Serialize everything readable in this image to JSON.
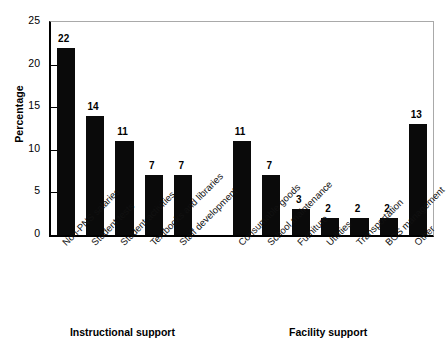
{
  "chart_data": {
    "type": "bar",
    "title": "",
    "subtitle": "",
    "xlabel": "",
    "ylabel": "Percentage",
    "ylim": [
      0,
      25
    ],
    "yticks": [
      0,
      5,
      10,
      15,
      20,
      25
    ],
    "grid": false,
    "legend": "none",
    "categories": [
      "Non-PNS salaries",
      "Student tests",
      "Student activities",
      "Textbooks and libraries",
      "Staff development",
      "Consumable goods",
      "School maintenance",
      "Furniture",
      "Utilities",
      "Transportation",
      "BOS management",
      "Other"
    ],
    "values": [
      22,
      14,
      11,
      7,
      7,
      11,
      7,
      3,
      2,
      2,
      2,
      13
    ],
    "value_labels": [
      "22",
      "14",
      "11",
      "7",
      "7",
      "11",
      "7",
      "3",
      "2",
      "2",
      "2",
      "13"
    ],
    "groups": [
      {
        "label": "Instructional support",
        "category_indices": [
          0,
          1,
          2,
          3,
          4
        ]
      },
      {
        "label": "Facility support",
        "category_indices": [
          5,
          6,
          7,
          8,
          9,
          10,
          11
        ]
      }
    ],
    "bar_color": "#0a0a0a",
    "axis_color": "#000000",
    "frame_color": "#a9a9a9",
    "background_color": "#ffffff"
  },
  "axis": {
    "y_tick_labels": [
      "0",
      "5",
      "10",
      "15",
      "20",
      "25"
    ],
    "y_title": "Percentage"
  },
  "groups": {
    "left_label": "Instructional support",
    "right_label": "Facility support"
  }
}
